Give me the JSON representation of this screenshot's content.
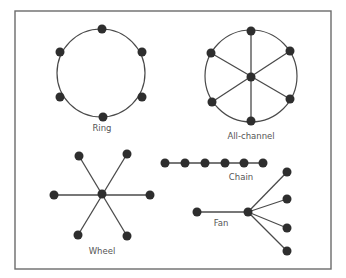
{
  "figure": {
    "colors": {
      "frame": "#6b6b6b",
      "edge": "#4a4a4a",
      "node": "#2e2e2e",
      "label": "#555555",
      "background": "#ffffff"
    },
    "frame": {
      "x": 15,
      "y": 11,
      "width": 316,
      "height": 258
    },
    "node_radius": 4.5,
    "networks": [
      {
        "id": "ring",
        "label": "Ring",
        "label_pos": [
          102,
          131
        ],
        "circle": {
          "cx": 101,
          "cy": 73,
          "r": 44
        },
        "nodes": [
          [
            102,
            29
          ],
          [
            142,
            52
          ],
          [
            142,
            97
          ],
          [
            103,
            117
          ],
          [
            60,
            97
          ],
          [
            60,
            52
          ]
        ],
        "edges": []
      },
      {
        "id": "all-channel",
        "label": "All-channel",
        "label_pos": [
          251,
          139
        ],
        "circle": {
          "cx": 251,
          "cy": 76,
          "r": 46
        },
        "center": [
          251,
          77
        ],
        "nodes": [
          [
            251,
            31
          ],
          [
            290,
            51
          ],
          [
            290,
            99
          ],
          [
            251,
            121
          ],
          [
            212,
            102
          ],
          [
            211,
            53
          ]
        ],
        "edges": [
          [
            [
              251,
              31
            ],
            [
              251,
              121
            ]
          ],
          [
            [
              290,
              51
            ],
            [
              212,
              102
            ]
          ],
          [
            [
              290,
              99
            ],
            [
              211,
              53
            ]
          ]
        ]
      },
      {
        "id": "wheel",
        "label": "Wheel",
        "label_pos": [
          102,
          254
        ],
        "center": [
          102,
          194
        ],
        "nodes": [
          [
            79,
            156
          ],
          [
            127,
            154
          ],
          [
            54,
            195
          ],
          [
            150,
            195
          ],
          [
            78,
            235
          ],
          [
            127,
            236
          ]
        ],
        "edges": [
          [
            [
              79,
              156
            ],
            [
              127,
              236
            ]
          ],
          [
            [
              127,
              154
            ],
            [
              78,
              235
            ]
          ],
          [
            [
              54,
              195
            ],
            [
              150,
              195
            ]
          ]
        ]
      },
      {
        "id": "chain",
        "label": "Chain",
        "label_pos": [
          241,
          180
        ],
        "nodes": [
          [
            165,
            163
          ],
          [
            185,
            163
          ],
          [
            205,
            163
          ],
          [
            225,
            163
          ],
          [
            244,
            163
          ],
          [
            263,
            163
          ]
        ],
        "edges": [
          [
            [
              165,
              163
            ],
            [
              263,
              163
            ]
          ]
        ]
      },
      {
        "id": "fan",
        "label": "Fan",
        "label_pos": [
          221,
          226
        ],
        "center": [
          248,
          212
        ],
        "nodes": [
          [
            197,
            212
          ],
          [
            287,
            172
          ],
          [
            287,
            199
          ],
          [
            287,
            228
          ],
          [
            287,
            251
          ]
        ],
        "edges": [
          [
            [
              197,
              212
            ],
            [
              248,
              212
            ]
          ],
          [
            [
              248,
              212
            ],
            [
              287,
              172
            ]
          ],
          [
            [
              248,
              212
            ],
            [
              287,
              199
            ]
          ],
          [
            [
              248,
              212
            ],
            [
              287,
              228
            ]
          ],
          [
            [
              248,
              212
            ],
            [
              287,
              251
            ]
          ]
        ]
      }
    ]
  }
}
